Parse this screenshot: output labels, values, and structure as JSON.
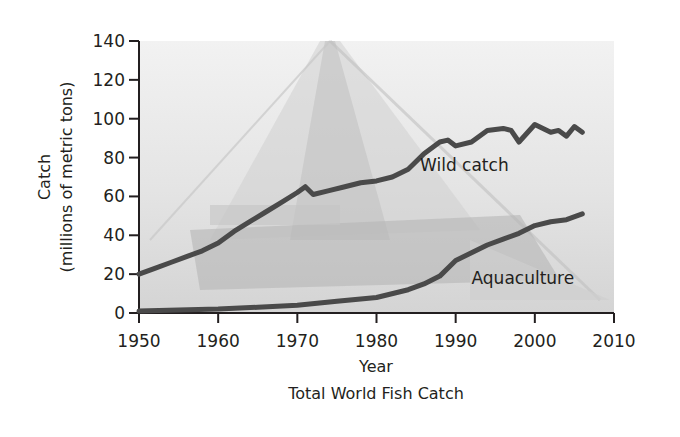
{
  "chart_data": {
    "type": "line",
    "title": "Total World Fish Catch",
    "xlabel": "Year",
    "ylabel": "Catch",
    "ylabel_sub": "(millions of metric tons)",
    "xlim": [
      1950,
      2010
    ],
    "ylim": [
      0,
      140
    ],
    "x_ticks": [
      1950,
      1960,
      1970,
      1980,
      1990,
      2000,
      2010
    ],
    "y_ticks": [
      0,
      20,
      40,
      60,
      80,
      100,
      120,
      140
    ],
    "grid": false,
    "legend": "inline labels",
    "background": "faded photograph of a fishing net / trawler",
    "series": [
      {
        "name": "Wild catch",
        "label": "Wild catch",
        "color": "#4a4a4a",
        "x": [
          1950,
          1952,
          1954,
          1956,
          1958,
          1960,
          1962,
          1964,
          1966,
          1968,
          1970,
          1971,
          1972,
          1974,
          1976,
          1978,
          1980,
          1982,
          1984,
          1986,
          1988,
          1989,
          1990,
          1992,
          1994,
          1996,
          1997,
          1998,
          2000,
          2002,
          2003,
          2004,
          2005,
          2006
        ],
        "values": [
          20,
          23,
          26,
          29,
          32,
          36,
          42,
          47,
          52,
          57,
          62,
          65,
          61,
          63,
          65,
          67,
          68,
          70,
          74,
          82,
          88,
          89,
          86,
          88,
          94,
          95,
          94,
          88,
          97,
          93,
          94,
          91,
          96,
          93
        ]
      },
      {
        "name": "Aquaculture",
        "label": "Aquaculture",
        "color": "#4a4a4a",
        "x": [
          1950,
          1955,
          1960,
          1965,
          1970,
          1975,
          1980,
          1984,
          1986,
          1988,
          1990,
          1992,
          1994,
          1996,
          1998,
          2000,
          2002,
          2004,
          2006
        ],
        "values": [
          1,
          1.5,
          2,
          3,
          4,
          6,
          8,
          12,
          15,
          19,
          27,
          31,
          35,
          38,
          41,
          45,
          47,
          48,
          51
        ]
      }
    ],
    "annotations": [
      {
        "text": "Wild catch",
        "x": 1985.5,
        "y": 73
      },
      {
        "text": "Aquaculture",
        "x": 1992,
        "y": 15
      }
    ]
  }
}
